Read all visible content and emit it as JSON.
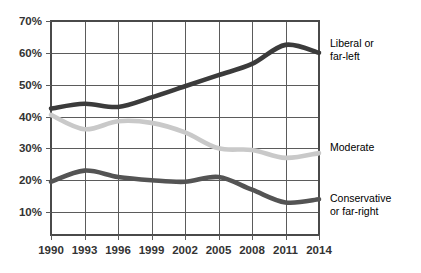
{
  "chart_data": {
    "type": "line",
    "title": "",
    "subtitle": "",
    "xlabel": "",
    "ylabel": "",
    "grid": true,
    "legend_position": "right-of-plot",
    "x": [
      1990,
      1993,
      1996,
      1999,
      2002,
      2005,
      2008,
      2011,
      2014
    ],
    "xlim": [
      1990,
      2014
    ],
    "ylim": [
      5,
      70
    ],
    "y_ticks": [
      10,
      20,
      30,
      40,
      50,
      60,
      70
    ],
    "y_tick_labels": [
      "10%",
      "20%",
      "30%",
      "40%",
      "50%",
      "60%",
      "70%"
    ],
    "x_tick_labels": [
      "1990",
      "1993",
      "1996",
      "1999",
      "2002",
      "2005",
      "2008",
      "2011",
      "2014"
    ],
    "series": [
      {
        "name": "Liberal or far-left",
        "label_lines": [
          "Liberal or",
          "far-left"
        ],
        "color": "#3b3b3b",
        "values": [
          42.5,
          44.0,
          43.0,
          46.0,
          49.5,
          53.0,
          56.5,
          62.5,
          60.0
        ]
      },
      {
        "name": "Moderate",
        "label_lines": [
          "Moderate"
        ],
        "color": "#c9c9c9",
        "values": [
          40.5,
          36.0,
          38.5,
          38.0,
          35.0,
          30.0,
          29.5,
          27.0,
          28.5
        ]
      },
      {
        "name": "Conservative or far-right",
        "label_lines": [
          "Conservative",
          "or far-right"
        ],
        "color": "#545454",
        "values": [
          19.5,
          23.0,
          21.0,
          20.0,
          19.5,
          21.0,
          17.0,
          13.0,
          14.0
        ]
      }
    ]
  },
  "axes": {
    "y_labels": [
      "70%",
      "60%",
      "50%",
      "40%",
      "30%",
      "20%",
      "10%"
    ],
    "x_labels": [
      "1990",
      "1993",
      "1996",
      "1999",
      "2002",
      "2005",
      "2008",
      "2011",
      "2014"
    ]
  },
  "legend": {
    "liberal_line1": "Liberal or",
    "liberal_line2": "far-left",
    "moderate_line1": "Moderate",
    "conservative_line1": "Conservative",
    "conservative_line2": "or far-right"
  },
  "colors": {
    "liberal": "#3b3b3b",
    "moderate": "#c9c9c9",
    "conservative": "#545454",
    "grid": "#5b5b5b",
    "frame": "#4a4a4a",
    "text": "#333333",
    "background": "#ffffff"
  }
}
